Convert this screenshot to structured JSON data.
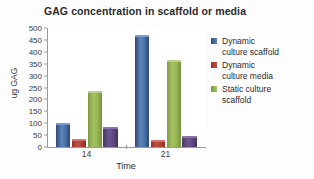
{
  "chart_data": {
    "type": "bar",
    "title": "GAG concentration in scaffold or media",
    "xlabel": "Time",
    "ylabel": "ug GAG",
    "categories": [
      "14",
      "21"
    ],
    "ylim": [
      0,
      500
    ],
    "yticks": [
      0,
      50,
      100,
      150,
      200,
      250,
      300,
      350,
      400,
      450,
      500
    ],
    "grid": false,
    "legend_position": "right",
    "series": [
      {
        "name": "Dynamic culture scaffold",
        "values": [
          100,
          470
        ],
        "color": "#4f7ab4"
      },
      {
        "name": "Dynamic culture media",
        "values": [
          35,
          30
        ],
        "color": "#c0504d"
      },
      {
        "name": "Static culture scaffold",
        "values": [
          235,
          365
        ],
        "color": "#9bbb59"
      },
      {
        "name": "",
        "values": [
          82,
          45
        ],
        "color": "#6d5690"
      }
    ]
  },
  "legend": {
    "items": [
      {
        "label": "Dynamic\nculture scaffold"
      },
      {
        "label": "Dynamic\nculture media"
      },
      {
        "label": "Static culture\nscaffold"
      }
    ]
  }
}
